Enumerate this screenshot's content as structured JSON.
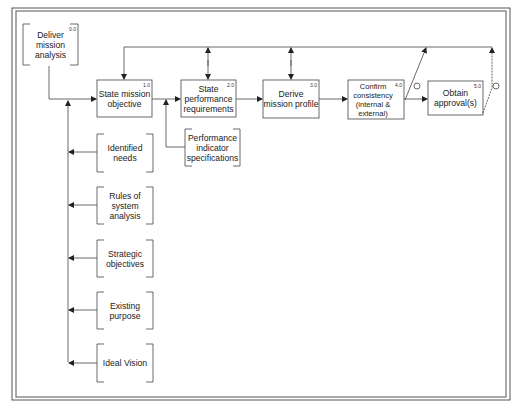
{
  "diagram": {
    "type": "process-flow",
    "start": {
      "id": "0.0",
      "label": "Deliver mission analysis"
    },
    "processes": [
      {
        "id": "1.0",
        "label": "State mission objective"
      },
      {
        "id": "2.0",
        "label": "State performance requirements"
      },
      {
        "id": "3.0",
        "label": "Derive mission profile"
      },
      {
        "id": "4.0",
        "label": "Confirm consistency (internal & external)"
      },
      {
        "id": "5.0",
        "label": "Obtain approval(s)"
      }
    ],
    "output": {
      "label": "Performance indicator specifications"
    },
    "inputs": [
      {
        "label": "Identified needs"
      },
      {
        "label": "Rules of system analysis"
      },
      {
        "label": "Strategic objectives"
      },
      {
        "label": "Existing purpose"
      },
      {
        "label": "Ideal Vision"
      }
    ],
    "decision_symbol": "☹",
    "colors": {
      "line": "#444444",
      "text": "#222222",
      "background": "#ffffff"
    }
  }
}
